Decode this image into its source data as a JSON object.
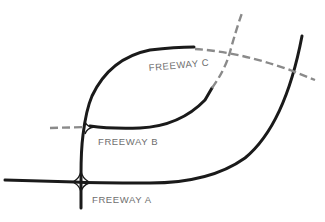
{
  "diagram": {
    "colors": {
      "built_road": "#1a1a1a",
      "planned_road": "#8a8a8a",
      "label_text": "#6e6e6e",
      "background": "#ffffff"
    },
    "legend_semantics": {
      "solid": "existing freeway",
      "dashed": "proposed freeway"
    },
    "labels": {
      "freeway_a": "FREEWAY A",
      "freeway_b": "FREEWAY B",
      "freeway_c": "FREEWAY C"
    },
    "interchanges": [
      {
        "name": "Freeway A / north-south connector",
        "type": "cloverleaf"
      },
      {
        "name": "Freeway B / north-south connector",
        "type": "directional"
      },
      {
        "name": "dashed crossing northeast",
        "type": "at-grade crossing"
      }
    ]
  }
}
